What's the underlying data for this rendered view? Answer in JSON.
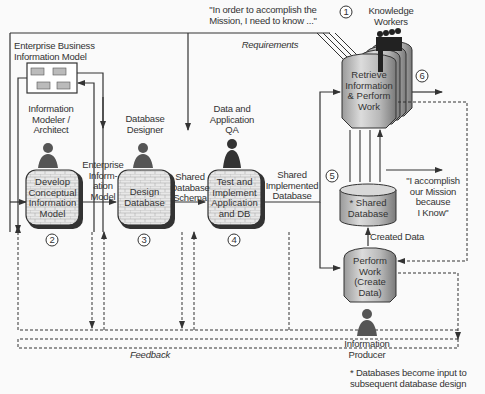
{
  "diagram": {
    "enterprise_model": {
      "title_line1": "Enterprise Business",
      "title_line2": "Information Model"
    },
    "roles": {
      "modeler": {
        "line1": "Information",
        "line2": "Modeler /",
        "line3": "Architect"
      },
      "designer": {
        "line1": "Database",
        "line2": "Designer"
      },
      "qa": {
        "line1": "Data and",
        "line2": "Application",
        "line3": "QA"
      },
      "knowledge_workers": {
        "number": "1",
        "line1": "Knowledge",
        "line2": "Workers"
      },
      "producer": {
        "line1": "Information",
        "line2": "Producer"
      }
    },
    "processes": [
      {
        "number": "2",
        "line1": "Develop",
        "line2": "Conceptual",
        "line3": "Information",
        "line4": "Model"
      },
      {
        "number": "3",
        "line1": "Design",
        "line2": "Database"
      },
      {
        "number": "4",
        "line1": "Test and",
        "line2": "Implement",
        "line3": "Application",
        "line4": "and DB"
      },
      {
        "number": "6",
        "line1": "Retrieve",
        "line2": "Information",
        "line3": "& Perform",
        "line4": "Work"
      },
      {
        "line1": "Perform",
        "line2": "Work",
        "line3": "(Create",
        "line4": "Data)"
      }
    ],
    "flows": {
      "enterprise_info_model": {
        "line1": "Enterprise",
        "line2": "Inform-",
        "line3": "ation",
        "line4": "Model"
      },
      "shared_schema": {
        "line1": "Shared",
        "line2": "Database",
        "line3": "Schema"
      },
      "shared_implemented": {
        "line1": "Shared",
        "line2": "Implemented",
        "line3": "Database"
      },
      "created_data": "Created Data",
      "feedback": "Feedback",
      "requirements": "Requirements"
    },
    "database": {
      "number": "5",
      "line1": "* Shared",
      "line2": "Database"
    },
    "quotes": {
      "need_line1": "\"In order to accomplish the",
      "need_line2": "Mission, I need to know ...\"",
      "know_line1": "\"I accomplish",
      "know_line2": "our Mission",
      "know_line3": "because",
      "know_line4": "I Know\""
    },
    "footnote": {
      "line1": "* Databases become input to",
      "line2": "subsequent database design"
    }
  }
}
